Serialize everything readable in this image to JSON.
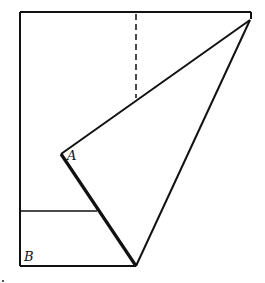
{
  "diagram": {
    "type": "geometric-fold",
    "stroke_color": "#111111",
    "background": "#ffffff",
    "labels": {
      "a": "A",
      "b": "B"
    },
    "rectangle": {
      "x1": 20,
      "y1": 12,
      "x2": 251,
      "y2": 266
    },
    "points": {
      "A": [
        61,
        154
      ],
      "top_right_apex": [
        250,
        20
      ],
      "bottom_vertex": [
        136,
        266
      ],
      "fold_dashed_top": [
        136,
        14
      ],
      "fold_dashed_bottom": [
        136,
        98
      ],
      "horizontal_line_left": [
        20,
        211
      ],
      "horizontal_line_right": [
        97,
        211
      ]
    }
  }
}
